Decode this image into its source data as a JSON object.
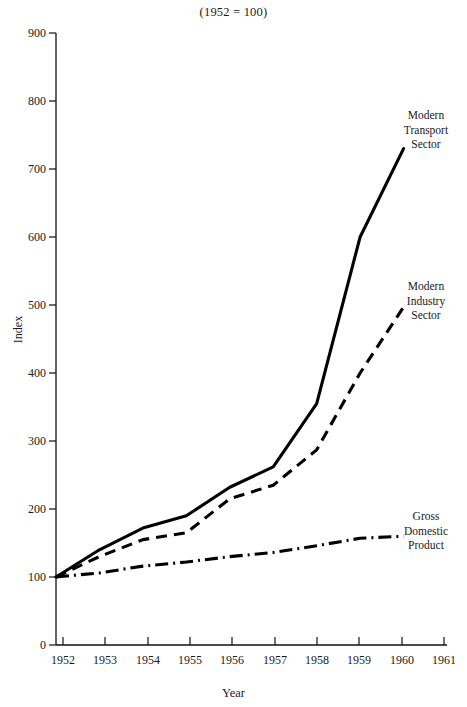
{
  "chart_data": {
    "type": "line",
    "title": "(1952 = 100)",
    "subtitle": "",
    "xlabel": "Year",
    "ylabel": "Index",
    "x": [
      1952,
      1953,
      1954,
      1955,
      1956,
      1957,
      1958,
      1959,
      1960
    ],
    "tick_labels_x": [
      "1952",
      "1953",
      "1954",
      "1955",
      "1956",
      "1957",
      "1958",
      "1959",
      "1960",
      "1961"
    ],
    "tick_values_y": [
      0,
      100,
      200,
      300,
      400,
      500,
      600,
      700,
      800,
      900
    ],
    "tick_labels_y": [
      "0",
      "100",
      "200",
      "300",
      "400",
      "500",
      "600",
      "700",
      "800",
      "900"
    ],
    "xlim": [
      1952,
      1961
    ],
    "ylim": [
      0,
      900
    ],
    "grid": false,
    "legend_position": "right-inline-annotations",
    "series": [
      {
        "name": "Modern Transport Sector",
        "label_lines": "Modern\nTransport\nSector",
        "linestyle": "solid",
        "color": "#000000",
        "values": [
          100,
          140,
          172,
          190,
          232,
          262,
          355,
          600,
          730
        ]
      },
      {
        "name": "Modern Industry Sector",
        "label_lines": "Modern\nIndustry\nSector",
        "linestyle": "dashed",
        "color": "#000000",
        "values": [
          100,
          130,
          155,
          165,
          215,
          235,
          287,
          400,
          497
        ]
      },
      {
        "name": "Gross Domestic Product",
        "label_lines": "Gross\nDomestic\nProduct",
        "linestyle": "dashdot",
        "color": "#000000",
        "values": [
          100,
          106,
          116,
          122,
          130,
          136,
          146,
          157,
          160
        ]
      }
    ]
  },
  "axis_geometry": {
    "plot_left": 56,
    "plot_right": 447,
    "plot_top": 33,
    "plot_bottom": 645,
    "px_per_year": 42.3,
    "px_per_unit": 0.68
  },
  "annotations": [
    {
      "text_lines": "Modern\nTransport\nSector",
      "x": 399,
      "y": 110
    },
    {
      "text_lines": "Modern\nIndustry\nSector",
      "x": 399,
      "y": 281
    },
    {
      "text_lines": "Gross\nDomestic\nProduct",
      "x": 399,
      "y": 511
    }
  ]
}
